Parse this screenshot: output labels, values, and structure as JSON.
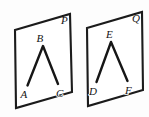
{
  "figure": {
    "background_color": "#fdfdfd",
    "line_color": "#161616",
    "plane_fill_color": "#ffffff",
    "width": 149,
    "height": 117
  },
  "planes": [
    {
      "name": "plane-p",
      "label": "P",
      "label_x": 61,
      "label_y": 24,
      "corners": "15,30 70,14 72,92 16,108",
      "angle": {
        "name": "angle-abc",
        "vertex_label": "B",
        "vertex_x": 43,
        "vertex_y": 46,
        "ray_path": "M 27.5,85.5 L 43,46 L 58,84",
        "points": [
          {
            "label": "A",
            "label_x": 20.5,
            "label_y": 98
          },
          {
            "label": "B",
            "label_x": 36.5,
            "label_y": 42
          },
          {
            "label": "C",
            "label_x": 56,
            "label_y": 97
          }
        ]
      }
    },
    {
      "name": "plane-q",
      "label": "Q",
      "label_x": 132,
      "label_y": 22,
      "corners": "87,28 142,12 143,90 88,106",
      "angle": {
        "name": "angle-def",
        "vertex_label": "E",
        "vertex_x": 111,
        "vertex_y": 42,
        "ray_path": "M 96.5,82 L 111,42 L 127.5,81",
        "points": [
          {
            "label": "D",
            "label_x": 89,
            "label_y": 95
          },
          {
            "label": "E",
            "label_x": 106,
            "label_y": 38
          },
          {
            "label": "F",
            "label_x": 125,
            "label_y": 94
          }
        ]
      }
    }
  ]
}
